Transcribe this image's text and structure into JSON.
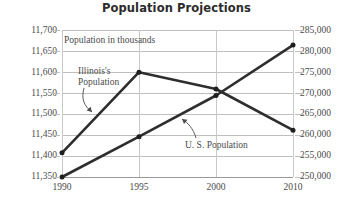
{
  "chart_data": {
    "type": "line",
    "title": "Population Projections",
    "xlabel": "",
    "ylabel": "",
    "grid": true,
    "legend_position": "inline-annotations",
    "categories": [
      "1990",
      "1995",
      "2000",
      "2010"
    ],
    "x": [
      1990,
      1995,
      2000,
      2010
    ],
    "xtick_labels": [
      "1990",
      "1995",
      "2000",
      "2010"
    ],
    "annotations": [
      "Population in thousands",
      "Illinois's\nPopulation",
      "U. S. Population"
    ],
    "axes": [
      {
        "id": "left",
        "name": "Illinois's Population",
        "ylim": [
          11350,
          11700
        ],
        "tick_step": 50,
        "tick_labels": [
          "11,700",
          "11,650",
          "11,600",
          "11,550",
          "11,500",
          "11,450",
          "11,400",
          "11,350"
        ],
        "tick_values": [
          11700,
          11650,
          11600,
          11550,
          11500,
          11450,
          11400,
          11350
        ]
      },
      {
        "id": "right",
        "name": "U. S. Population",
        "ylim": [
          250000,
          285000
        ],
        "tick_step": 5000,
        "tick_labels": [
          "285,000",
          "280,000",
          "275,000",
          "270,000",
          "265,000",
          "260,000",
          "255,000",
          "250,000"
        ],
        "tick_values": [
          285000,
          280000,
          275000,
          270000,
          265000,
          260000,
          255000,
          250000
        ]
      }
    ],
    "series": [
      {
        "name": "Illinois's Population",
        "axis": "left",
        "units": "thousands",
        "values": [
          11438,
          11630,
          11590,
          11492
        ]
      },
      {
        "name": "U. S. Population",
        "axis": "right",
        "units": "thousands",
        "values": [
          250000,
          259600,
          269400,
          281400
        ]
      }
    ],
    "colors": {
      "line": "#2e2e2e",
      "marker": "#1f1f1f",
      "grid": "#bfbfbf",
      "text": "#4a4a4a",
      "title": "#2b2b2b",
      "background": "#ffffff"
    }
  }
}
